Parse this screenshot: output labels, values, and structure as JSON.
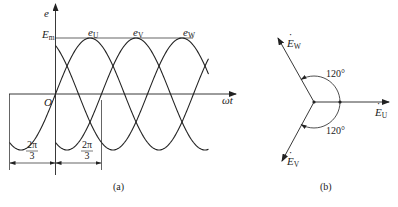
{
  "figure_a": {
    "caption": "(a)",
    "axis_y_label": "e",
    "axis_x_label": "ωt",
    "origin_label": "O",
    "peak_label": "E",
    "peak_sub": "m",
    "curves": [
      {
        "label": "e",
        "sub": "U"
      },
      {
        "label": "e",
        "sub": "V"
      },
      {
        "label": "e",
        "sub": "W"
      }
    ],
    "dim_left": {
      "num": "2π",
      "den": "3"
    },
    "dim_right": {
      "num": "2π",
      "den": "3"
    }
  },
  "figure_b": {
    "caption": "(b)",
    "phasors": [
      {
        "label": "E",
        "sub": "U"
      },
      {
        "label": "E",
        "sub": "V"
      },
      {
        "label": "E",
        "sub": "W"
      }
    ],
    "angle_top": "120°",
    "angle_bottom": "120°"
  },
  "colors": {
    "stroke": "#222222",
    "background": "#ffffff"
  }
}
